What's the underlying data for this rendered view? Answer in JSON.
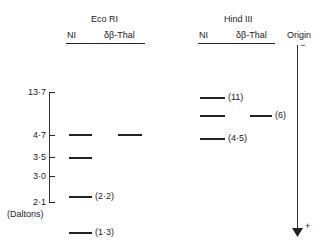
{
  "groups": [
    {
      "title": "Eco RI",
      "lanes": [
        "NI",
        "δβ-Thal"
      ]
    },
    {
      "title": "Hind III",
      "lanes": [
        "NI",
        "δβ-Thal"
      ]
    }
  ],
  "origin": {
    "label": "Origin",
    "top_sign": "−",
    "bottom_sign": "+"
  },
  "axis": {
    "unit_label": "(Daltons)",
    "ticks": [
      {
        "label": "13·7",
        "y": 92
      },
      {
        "label": "4·7",
        "y": 135
      },
      {
        "label": "3·5",
        "y": 157
      },
      {
        "label": "3·0",
        "y": 176
      },
      {
        "label": "2·1",
        "y": 202
      }
    ]
  },
  "bands": {
    "ecori_ni": [
      {
        "y": 134,
        "label": ""
      },
      {
        "y": 157,
        "label": ""
      },
      {
        "y": 196,
        "label": "(2·2)"
      },
      {
        "y": 232,
        "label": "(1·3)"
      }
    ],
    "ecori_thal": [
      {
        "y": 134,
        "label": ""
      }
    ],
    "hind_ni": [
      {
        "y": 97,
        "label": "(11)"
      },
      {
        "y": 115,
        "label": ""
      },
      {
        "y": 138,
        "label": "(4·5)"
      }
    ],
    "hind_thal": [
      {
        "y": 115,
        "label": "(6)"
      }
    ]
  }
}
